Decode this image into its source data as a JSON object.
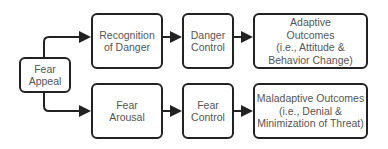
{
  "diagram": {
    "nodes": [
      {
        "id": "fear-appeal",
        "label": "Fear\nAppeal"
      },
      {
        "id": "recognition-of-danger",
        "label": "Recognition\nof Danger"
      },
      {
        "id": "fear-arousal",
        "label": "Fear\nArousal"
      },
      {
        "id": "danger-control",
        "label": "Danger\nControl"
      },
      {
        "id": "fear-control",
        "label": "Fear\nControl"
      },
      {
        "id": "adaptive-outcomes",
        "label": "Adaptive\nOutcomes\n(i.e., Attitude &\nBehavior Change)"
      },
      {
        "id": "maladaptive-outcomes",
        "label": "Maladaptive Outcomes\n(i.e., Denial &\nMinimization of Threat)"
      }
    ],
    "edges": [
      {
        "from": "fear-appeal",
        "to": "recognition-of-danger"
      },
      {
        "from": "fear-appeal",
        "to": "fear-arousal"
      },
      {
        "from": "recognition-of-danger",
        "to": "danger-control"
      },
      {
        "from": "fear-arousal",
        "to": "fear-control"
      },
      {
        "from": "danger-control",
        "to": "adaptive-outcomes"
      },
      {
        "from": "fear-control",
        "to": "maladaptive-outcomes"
      }
    ]
  }
}
